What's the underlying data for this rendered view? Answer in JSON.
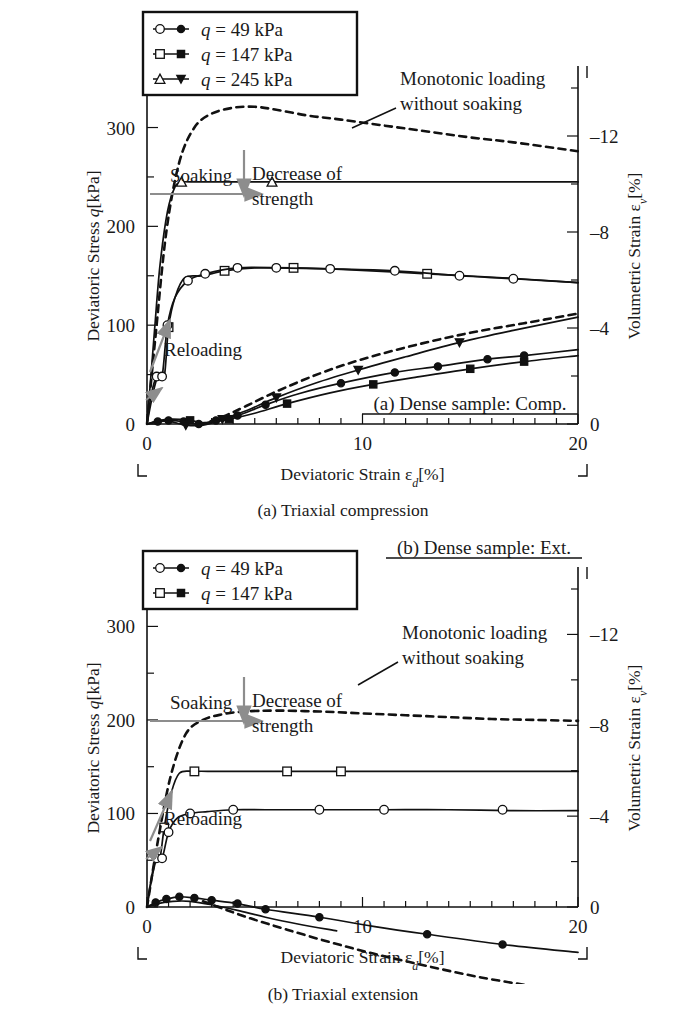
{
  "figure": {
    "panels": [
      {
        "id": "a",
        "caption": "(a) Triaxial compression",
        "sample_label": "(a) Dense sample: Comp.",
        "legend": {
          "entries": [
            {
              "label": "q = 49 kPa",
              "q_italic": "q",
              "rest": " = 49 kPa",
              "open_marker": "circle",
              "filled_marker": "circle"
            },
            {
              "label": "q = 147 kPa",
              "q_italic": "q",
              "rest": " = 147 kPa",
              "open_marker": "square",
              "filled_marker": "square"
            },
            {
              "label": "q = 245 kPa",
              "q_italic": "q",
              "rest": " = 245 kPa",
              "open_marker": "triangle-up",
              "filled_marker": "triangle-down"
            }
          ]
        },
        "annotations": [
          {
            "name": "monotonic-loading",
            "line1": "Monotonic loading",
            "line2": "without soaking"
          },
          {
            "name": "soaking",
            "text": "Soaking"
          },
          {
            "name": "decrease-of-strength",
            "line1": "Decrease of",
            "line2": "strength"
          },
          {
            "name": "reloading",
            "text": "Reloading"
          }
        ]
      },
      {
        "id": "b",
        "caption": "(b) Triaxial extension",
        "sample_label": "(b) Dense sample: Ext.",
        "legend": {
          "entries": [
            {
              "label": "q = 49 kPa",
              "q_italic": "q",
              "rest": " = 49 kPa",
              "open_marker": "circle",
              "filled_marker": "circle"
            },
            {
              "label": "q = 147 kPa",
              "q_italic": "q",
              "rest": " = 147 kPa",
              "open_marker": "square",
              "filled_marker": "square"
            }
          ]
        },
        "annotations": [
          {
            "name": "monotonic-loading",
            "line1": "Monotonic loading",
            "line2": "without soaking"
          },
          {
            "name": "soaking",
            "text": "Soaking"
          },
          {
            "name": "decrease-of-strength",
            "line1": "Decrease of",
            "line2": "strength"
          },
          {
            "name": "reloading",
            "text": "Reloading"
          }
        ]
      }
    ]
  },
  "chart_data": [
    {
      "type": "line",
      "id": "panel-a",
      "title": "(a) Triaxial compression",
      "subtitle": "(a) Dense sample: Comp.",
      "xlabel": "Deviatoric Strain εd[%]",
      "xlabel_main": "Deviatoric Strain ",
      "xlabel_sym": "ε",
      "xlabel_sub": "d",
      "xlabel_unit": "[%]",
      "ylabel": "Deviatoric Stress q[kPa]",
      "ylabel_main": "Deviatoric Stress ",
      "ylabel_sym": "q",
      "ylabel_unit": "[kPa]",
      "y2label": "Volumetric Strain εv[%]",
      "y2label_main": "Volumetric Strain ",
      "y2label_sym": "ε",
      "y2label_sub": "v",
      "y2label_unit": "[%]",
      "xlim": [
        0,
        20
      ],
      "ylim": [
        0,
        340
      ],
      "y2lim": [
        0,
        -14
      ],
      "xticks": [
        0,
        10,
        20
      ],
      "xticks_minor_step": 1,
      "yticks": [
        0,
        100,
        200,
        300
      ],
      "yticks_minor_step": 50,
      "y2ticks": [
        0,
        -4,
        -8,
        -12
      ],
      "y2ticks_minor_step": 2,
      "grid": false,
      "legend_position": "top-left",
      "series": [
        {
          "name": "q = 245 kPa (stress)",
          "axis": "left",
          "style": "solid",
          "marker": "triangle-up-open",
          "x": [
            0,
            0.15,
            0.35,
            0.6,
            0.95,
            1.3,
            1.6,
            2.0,
            5.8,
            20.0
          ],
          "y": [
            0,
            40,
            95,
            160,
            215,
            240,
            245,
            245,
            245,
            245
          ],
          "marker_x": [
            1.6,
            5.8
          ],
          "marker_y": [
            245,
            245
          ]
        },
        {
          "name": "q = 147 kPa (stress)",
          "axis": "left",
          "style": "solid",
          "marker": "square-open",
          "x": [
            0,
            0.25,
            0.5,
            0.8,
            1.0,
            1.3,
            1.75,
            2.6,
            3.6,
            5.0,
            6.8,
            9.5,
            13.0,
            16.5,
            20.0
          ],
          "y": [
            0,
            28,
            48,
            48,
            98,
            128,
            148,
            150,
            155,
            158,
            158,
            156,
            152,
            148,
            143
          ],
          "marker_x": [
            1.0,
            3.6,
            6.8,
            13.0
          ],
          "marker_y": [
            98,
            155,
            158,
            152
          ]
        },
        {
          "name": "q = 49 kPa (stress)",
          "axis": "left",
          "style": "solid",
          "marker": "circle-open",
          "x": [
            0,
            0.2,
            0.45,
            0.7,
            0.95,
            1.3,
            1.9,
            2.7,
            4.2,
            6.0,
            8.5,
            11.5,
            14.5,
            17.0,
            20.0
          ],
          "y": [
            0,
            30,
            48,
            48,
            100,
            128,
            145,
            152,
            158,
            158,
            157,
            155,
            150,
            147,
            143
          ],
          "marker_x": [
            0.45,
            0.7,
            0.95,
            1.9,
            2.7,
            4.2,
            6.0,
            8.5,
            11.5,
            14.5,
            17.0
          ],
          "marker_y": [
            48,
            48,
            100,
            145,
            152,
            158,
            158,
            157,
            155,
            150,
            147
          ]
        },
        {
          "name": "Monotonic loading without soaking (stress)",
          "axis": "left",
          "style": "dashed",
          "marker": "none",
          "x": [
            0,
            0.4,
            0.9,
            1.5,
            2.2,
            3.0,
            4.0,
            5.0,
            6.0,
            7.5,
            9.0,
            11.0,
            13.0,
            15.0,
            17.0,
            20.0
          ],
          "y": [
            0,
            90,
            195,
            265,
            300,
            314,
            320,
            321,
            318,
            312,
            308,
            302,
            296,
            290,
            285,
            276
          ]
        },
        {
          "name": "q = 49 kPa (volumetric strain)",
          "axis": "right",
          "style": "solid",
          "marker": "circle-filled",
          "x": [
            0,
            0.5,
            1.0,
            1.7,
            2.4,
            3.2,
            4.2,
            5.5,
            7.0,
            9.0,
            11.5,
            13.5,
            15.8,
            17.5,
            20.0
          ],
          "y2": [
            0,
            -0.1,
            -0.15,
            -0.1,
            0.0,
            -0.15,
            -0.35,
            -0.8,
            -1.25,
            -1.7,
            -2.15,
            -2.4,
            -2.7,
            -2.85,
            -3.1
          ],
          "marker_x": [
            0.5,
            1.0,
            1.7,
            2.4,
            3.2,
            4.2,
            5.5,
            9.0,
            11.5,
            13.5,
            15.8,
            17.5
          ],
          "marker_y2": [
            -0.1,
            -0.15,
            -0.1,
            0.0,
            -0.15,
            -0.35,
            -0.8,
            -1.7,
            -2.15,
            -2.4,
            -2.7,
            -2.85
          ]
        },
        {
          "name": "q = 147 kPa (volumetric strain)",
          "axis": "right",
          "style": "solid",
          "marker": "square-filled",
          "x": [
            0,
            0.6,
            1.2,
            2.0,
            2.8,
            3.8,
            5.0,
            6.5,
            8.5,
            10.5,
            12.5,
            15.0,
            17.5,
            20.0
          ],
          "y2": [
            0,
            -0.15,
            -0.2,
            -0.15,
            -0.05,
            -0.2,
            -0.45,
            -0.85,
            -1.3,
            -1.65,
            -1.95,
            -2.3,
            -2.6,
            -2.85
          ],
          "marker_x": [
            2.0,
            3.8,
            6.5,
            10.5,
            15.0,
            17.5
          ],
          "marker_y2": [
            -0.15,
            -0.2,
            -0.85,
            -1.65,
            -2.3,
            -2.6
          ]
        },
        {
          "name": "q = 245 kPa (volumetric strain)",
          "axis": "right",
          "style": "solid",
          "marker": "triangle-down-filled",
          "x": [
            0,
            0.5,
            1.1,
            1.8,
            2.6,
            3.5,
            4.6,
            6.0,
            7.8,
            9.8,
            12.0,
            14.5,
            17.0,
            20.0
          ],
          "y2": [
            0,
            -0.1,
            -0.1,
            0.05,
            0.05,
            -0.2,
            -0.55,
            -1.1,
            -1.7,
            -2.25,
            -2.8,
            -3.4,
            -3.9,
            -4.45
          ],
          "marker_x": [
            1.8,
            3.5,
            6.0,
            9.8,
            14.5
          ],
          "marker_y2": [
            0.05,
            -0.2,
            -1.1,
            -2.25,
            -3.4
          ]
        },
        {
          "name": "Monotonic loading without soaking (volumetric strain)",
          "axis": "right",
          "style": "dashed",
          "marker": "none",
          "x": [
            2.4,
            3.5,
            4.6,
            6.0,
            8.0,
            10.0,
            12.5,
            15.0,
            17.5,
            20.0
          ],
          "y2": [
            0.05,
            -0.3,
            -0.75,
            -1.35,
            -2.1,
            -2.7,
            -3.3,
            -3.8,
            -4.2,
            -4.6
          ]
        }
      ]
    },
    {
      "type": "line",
      "id": "panel-b",
      "title": "(b) Triaxial extension",
      "subtitle": "(b) Dense sample: Ext.",
      "xlabel": "Deviatoric Strain εd[%]",
      "xlabel_main": "Deviatoric Strain ",
      "xlabel_sym": "ε",
      "xlabel_sub": "d",
      "xlabel_unit": "[%]",
      "ylabel": "Deviatoric Stress q[kPa]",
      "ylabel_main": "Deviatoric Stress ",
      "ylabel_sym": "q",
      "ylabel_unit": "[kPa]",
      "y2label": "Volumetric Strain εv[%]",
      "y2label_main": "Volumetric Strain ",
      "y2label_sym": "ε",
      "y2label_sub": "v",
      "y2label_unit": "[%]",
      "xlim": [
        0,
        20
      ],
      "ylim": [
        0,
        340
      ],
      "y2lim": [
        0,
        -14
      ],
      "xticks": [
        0,
        10,
        20
      ],
      "xticks_minor_step": 1,
      "yticks": [
        0,
        100,
        200,
        300
      ],
      "yticks_minor_step": 50,
      "y2ticks": [
        0,
        -4,
        -8,
        -12
      ],
      "y2ticks_minor_step": 2,
      "grid": false,
      "legend_position": "top-left",
      "series": [
        {
          "name": "q = 147 kPa (stress)",
          "axis": "left",
          "style": "solid",
          "marker": "square-open",
          "x": [
            0,
            0.2,
            0.4,
            0.6,
            0.8,
            1.1,
            1.5,
            2.2,
            3.2,
            4.5,
            6.5,
            9.0,
            12.0,
            16.0,
            20.0
          ],
          "y": [
            0,
            30,
            52,
            52,
            85,
            120,
            143,
            145,
            145,
            145,
            145,
            145,
            145,
            145,
            145
          ],
          "marker_x": [
            0.8,
            2.2,
            6.5,
            9.0
          ],
          "marker_y": [
            85,
            145,
            145,
            145
          ]
        },
        {
          "name": "q = 49 kPa (stress)",
          "axis": "left",
          "style": "solid",
          "marker": "circle-open",
          "x": [
            0,
            0.2,
            0.45,
            0.7,
            1.0,
            1.4,
            2.0,
            2.8,
            4.0,
            5.5,
            8.0,
            11.0,
            14.0,
            17.0,
            20.0
          ],
          "y": [
            0,
            28,
            52,
            52,
            80,
            95,
            100,
            102,
            104,
            104,
            104,
            104,
            104,
            103,
            103
          ],
          "marker_x": [
            0.45,
            0.7,
            1.0,
            2.0,
            4.0,
            8.0,
            11.0,
            16.5
          ],
          "marker_y": [
            52,
            52,
            80,
            100,
            104,
            104,
            104,
            104
          ]
        },
        {
          "name": "Monotonic loading without soaking (stress)",
          "axis": "left",
          "style": "dashed",
          "marker": "none",
          "x": [
            0,
            0.5,
            1.1,
            1.8,
            2.6,
            3.5,
            4.5,
            6.0,
            8.0,
            10.0,
            12.0,
            14.0,
            16.0,
            18.0,
            20.0
          ],
          "y": [
            0,
            70,
            140,
            185,
            200,
            206,
            209,
            210,
            209,
            207,
            205,
            203,
            201,
            200,
            199
          ]
        },
        {
          "name": "q = 49 kPa (volumetric strain)",
          "axis": "right",
          "style": "solid",
          "marker": "circle-filled",
          "x": [
            0,
            0.4,
            0.9,
            1.5,
            2.2,
            3.0,
            4.2,
            5.5,
            8.0,
            10.5,
            13.0,
            16.5,
            20.0
          ],
          "y2": [
            0,
            -0.2,
            -0.35,
            -0.45,
            -0.4,
            -0.3,
            -0.15,
            0.1,
            0.45,
            0.85,
            1.2,
            1.65,
            2.0
          ],
          "marker_x": [
            0.4,
            0.9,
            1.5,
            2.2,
            3.0,
            4.2,
            5.5,
            8.0,
            13.0,
            16.5
          ],
          "marker_y2": [
            -0.2,
            -0.35,
            -0.45,
            -0.4,
            -0.3,
            -0.15,
            0.1,
            0.45,
            1.2,
            1.65
          ]
        },
        {
          "name": "q = 147 kPa (volumetric strain)",
          "axis": "right",
          "style": "solid",
          "marker": "square-filled",
          "x": [
            0,
            0.5,
            1.2,
            2.0,
            3.0,
            4.2,
            5.5,
            7.0,
            8.8
          ],
          "y2": [
            0,
            -0.15,
            -0.25,
            -0.25,
            -0.1,
            0.15,
            0.45,
            0.75,
            1.05
          ]
        },
        {
          "name": "Monotonic loading without soaking (volumetric strain)",
          "axis": "right",
          "style": "dashed",
          "marker": "none",
          "x": [
            2.6,
            3.6,
            4.8,
            6.5,
            8.5,
            10.5,
            13.0,
            15.5,
            18.0,
            20.0
          ],
          "y2": [
            -0.25,
            0.1,
            0.5,
            1.0,
            1.55,
            2.05,
            2.6,
            3.1,
            3.5,
            3.8
          ]
        }
      ]
    }
  ],
  "colors": {
    "line": "#111111",
    "annotation_arrow": "#8d8d8d",
    "text": "#1a1a1a",
    "background": "#ffffff"
  }
}
